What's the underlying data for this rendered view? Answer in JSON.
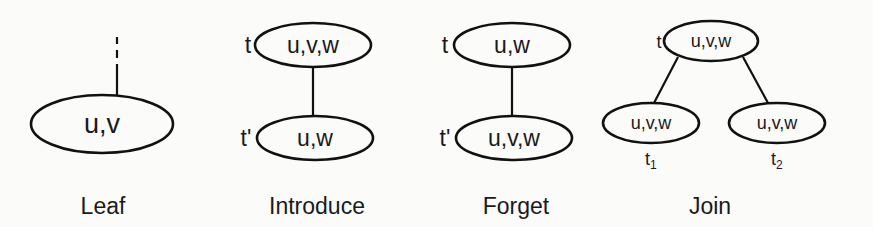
{
  "diagrams": {
    "leaf": {
      "caption": "Leaf",
      "node": {
        "label": "u,v"
      },
      "edge_above": "dashed-then-solid"
    },
    "introduce": {
      "caption": "Introduce",
      "parent": {
        "name": "t",
        "label": "u,v,w"
      },
      "child": {
        "name": "t'",
        "label": "u,w"
      }
    },
    "forget": {
      "caption": "Forget",
      "parent": {
        "name": "t",
        "label": "u,w"
      },
      "child": {
        "name": "t'",
        "label": "u,v,w"
      }
    },
    "join": {
      "caption": "Join",
      "parent": {
        "name": "t",
        "label": "u,v,w"
      },
      "left_child": {
        "name": "t",
        "sub": "1",
        "label": "u,v,w"
      },
      "right_child": {
        "name": "t",
        "sub": "2",
        "label": "u,v,w"
      }
    }
  },
  "colors": {
    "stroke": "#111111",
    "text": "#1a1a1a",
    "background": "#fbfbfa"
  }
}
